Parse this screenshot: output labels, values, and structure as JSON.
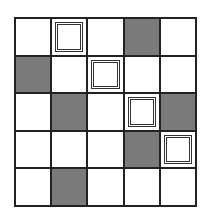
{
  "grid": {
    "rows": 5,
    "cols": 5,
    "colors": {
      "shaded": "#7a7a7a",
      "empty": "#ffffff",
      "line": "#222222"
    },
    "cells": [
      [
        "empty",
        "box",
        "empty",
        "shaded",
        "empty"
      ],
      [
        "shaded",
        "empty",
        "box",
        "empty",
        "empty"
      ],
      [
        "empty",
        "shaded",
        "empty",
        "box",
        "shaded"
      ],
      [
        "empty",
        "empty",
        "empty",
        "shaded",
        "box"
      ],
      [
        "empty",
        "shaded",
        "empty",
        "empty",
        "empty"
      ]
    ]
  }
}
